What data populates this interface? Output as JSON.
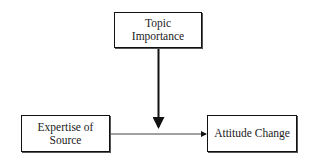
{
  "diagram": {
    "nodes": {
      "moderator": {
        "label_line1": "Topic",
        "label_line2": "Importance"
      },
      "source": {
        "label_line1": "Expertise of",
        "label_line2": "Source"
      },
      "outcome": {
        "label": "Attitude Change"
      }
    },
    "edges": [
      {
        "from": "source",
        "to": "outcome",
        "type": "direct-arrow"
      },
      {
        "from": "moderator",
        "to": "source-outcome-edge",
        "type": "moderating-arrow"
      }
    ]
  }
}
